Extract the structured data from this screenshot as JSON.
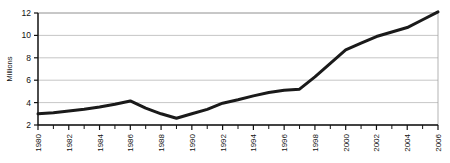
{
  "chart_data": {
    "type": "line",
    "title": "",
    "xlabel": "",
    "ylabel": "Millions",
    "x": [
      1980,
      1981,
      1982,
      1983,
      1984,
      1985,
      1986,
      1987,
      1988,
      1989,
      1990,
      1991,
      1992,
      1993,
      1994,
      1995,
      1996,
      1997,
      1998,
      1999,
      2000,
      2001,
      2002,
      2003,
      2004,
      2005,
      2006
    ],
    "values": [
      3.0,
      3.1,
      3.25,
      3.4,
      3.6,
      3.85,
      4.15,
      3.5,
      3.0,
      2.6,
      3.0,
      3.4,
      3.95,
      4.25,
      4.6,
      4.9,
      5.1,
      5.2,
      6.3,
      7.5,
      8.7,
      9.3,
      9.9,
      10.3,
      10.7,
      11.4,
      12.1
    ],
    "xlim": [
      1980,
      2006
    ],
    "ylim": [
      2,
      12
    ],
    "x_tick_labels": [
      "1980",
      "1982",
      "1984",
      "1986",
      "1988",
      "1990",
      "1992",
      "1994",
      "1996",
      "1998",
      "2000",
      "2002",
      "2004",
      "2006"
    ],
    "x_tick_values": [
      1980,
      1982,
      1984,
      1986,
      1988,
      1990,
      1992,
      1994,
      1996,
      1998,
      2000,
      2002,
      2004,
      2006
    ],
    "x_minor_tick_values": [
      1981,
      1983,
      1985,
      1987,
      1989,
      1991,
      1993,
      1995,
      1997,
      1999,
      2001,
      2003,
      2005
    ],
    "y_tick_labels": [
      "2",
      "4",
      "6",
      "8",
      "10",
      "12"
    ],
    "y_tick_values": [
      2,
      4,
      6,
      8,
      10,
      12
    ],
    "grid": {
      "horizontal": true,
      "vertical": false,
      "color": "#b8b8b8"
    },
    "legend": {
      "visible": false,
      "position": "none",
      "entries": []
    },
    "series": [
      {
        "name": "",
        "color": "#1a1a1a",
        "line_width": 3
      }
    ],
    "x_tick_label_rotation": -90,
    "plot_border": {
      "top": true,
      "right": true,
      "bottom": true,
      "left": true,
      "color": "#808080"
    },
    "axis_color": "#111111"
  }
}
